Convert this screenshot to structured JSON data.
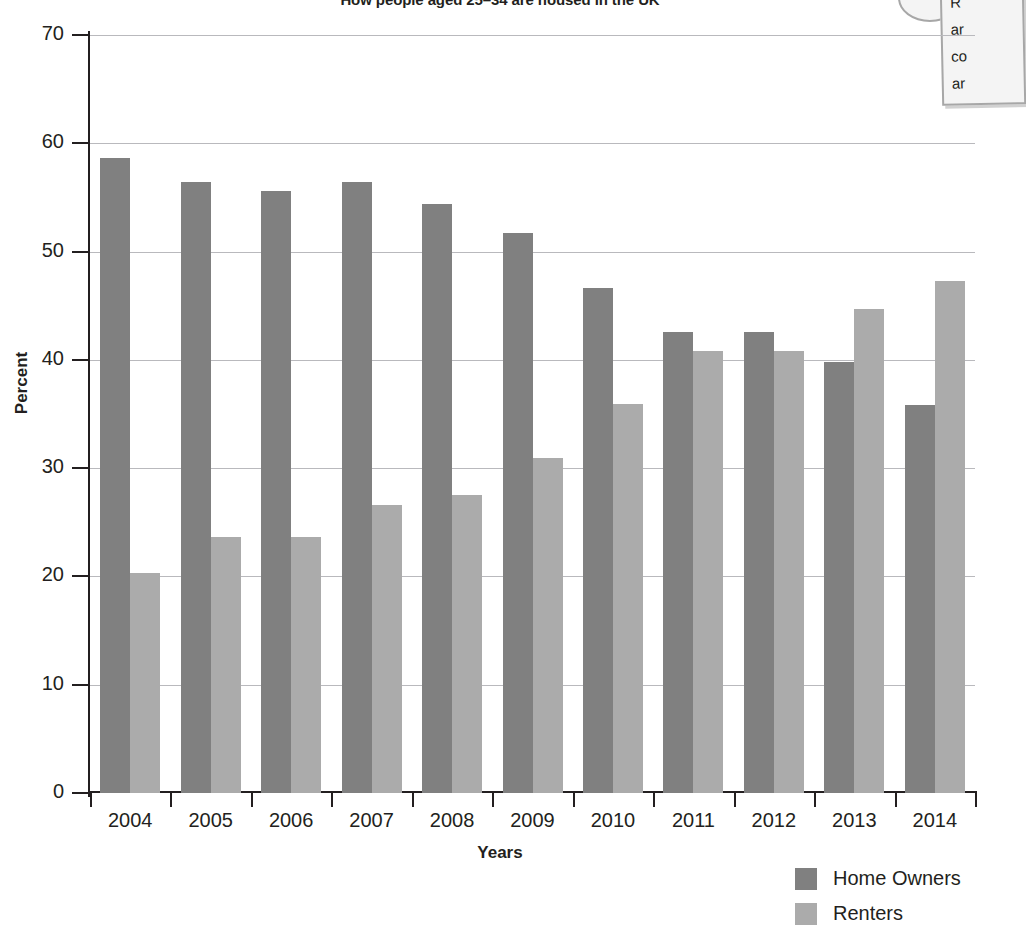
{
  "callout": {
    "visible_text": "R\nar\nco\nar",
    "bubble": "callout-bubble"
  },
  "legend": {
    "position": "bottom-right",
    "items": [
      {
        "label": "Home Owners",
        "color": "#808080"
      },
      {
        "label": "Renters",
        "color": "#ababab"
      }
    ]
  },
  "chart_data": {
    "type": "bar",
    "title": "How people aged 25–34 are housed in the UK",
    "xlabel": "Years",
    "ylabel": "Percent",
    "categories": [
      "2004",
      "2005",
      "2006",
      "2007",
      "2008",
      "2009",
      "2010",
      "2011",
      "2012",
      "2013",
      "2014"
    ],
    "series": [
      {
        "name": "Home Owners",
        "color": "#808080",
        "values": [
          58.6,
          56.4,
          55.6,
          56.4,
          54.4,
          51.7,
          46.6,
          42.6,
          42.6,
          39.8,
          35.8
        ]
      },
      {
        "name": "Renters",
        "color": "#ababab",
        "values": [
          20.3,
          23.6,
          23.6,
          26.6,
          27.5,
          30.9,
          35.9,
          40.8,
          40.8,
          44.7,
          47.3
        ]
      }
    ],
    "ylim": [
      0,
      70
    ],
    "yticks": [
      0,
      10,
      20,
      30,
      40,
      50,
      60,
      70
    ],
    "grid": true,
    "grid_axis": "y",
    "legend_position": "bottom-right"
  }
}
